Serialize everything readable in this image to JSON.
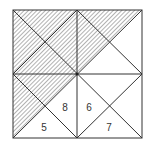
{
  "diagram": {
    "type": "square-partition",
    "colors": {
      "stroke": "#333333",
      "hatch": "#555555",
      "background": "#ffffff"
    },
    "labels": [
      {
        "text": "8",
        "x": 65,
        "y": 111
      },
      {
        "text": "6",
        "x": 89,
        "y": 111
      },
      {
        "text": "5",
        "x": 44,
        "y": 131
      },
      {
        "text": "7",
        "x": 109,
        "y": 131
      }
    ]
  }
}
